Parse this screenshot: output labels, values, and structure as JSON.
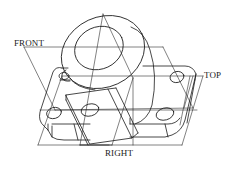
{
  "figure": {
    "type": "isometric projection drawing of a machined bracket with a cylindrical boss and mounting holes",
    "labels": {
      "front": "FRONT",
      "top": "TOP",
      "right": "RIGHT"
    },
    "colors": {
      "line": "#1a1a1a",
      "background": "#ffffff"
    }
  }
}
